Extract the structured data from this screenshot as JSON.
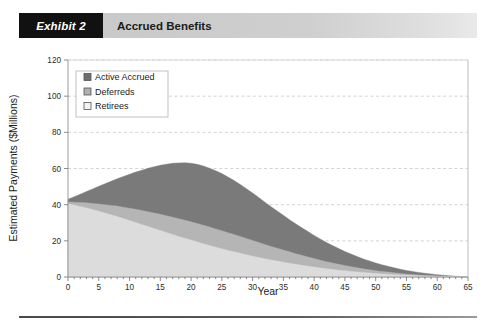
{
  "header": {
    "exhibit_tag": "Exhibit 2",
    "title": "Accrued Benefits"
  },
  "chart_data": {
    "type": "area",
    "stacked": true,
    "title": "Accrued Benefits",
    "xlabel": "Year",
    "ylabel": "Estimated Payments ($Millions)",
    "xlim": [
      0,
      65
    ],
    "ylim": [
      0,
      120
    ],
    "xticks": [
      0,
      5,
      10,
      15,
      20,
      25,
      30,
      35,
      40,
      45,
      50,
      55,
      60,
      65
    ],
    "yticks": [
      0,
      20,
      40,
      60,
      80,
      100,
      120
    ],
    "xtick_labels": [
      "0",
      "5",
      "10",
      "15",
      "20",
      "25",
      "30",
      "35",
      "40",
      "45",
      "50",
      "55",
      "60",
      "65"
    ],
    "ytick_labels": [
      "0",
      "20",
      "40",
      "60",
      "80",
      "100",
      "120"
    ],
    "grid": "horizontal-dashed",
    "legend_position": "upper-left-inside",
    "x": [
      0,
      1,
      2,
      3,
      4,
      5,
      6,
      7,
      8,
      9,
      10,
      11,
      12,
      13,
      14,
      15,
      16,
      17,
      18,
      19,
      20,
      21,
      22,
      23,
      24,
      25,
      26,
      27,
      28,
      29,
      30,
      31,
      32,
      33,
      34,
      35,
      36,
      37,
      38,
      39,
      40,
      41,
      42,
      43,
      44,
      45,
      46,
      47,
      48,
      49,
      50,
      51,
      52,
      53,
      54,
      55,
      56,
      57,
      58,
      59,
      60,
      61,
      62,
      63,
      64,
      65
    ],
    "series": [
      {
        "name": "Retirees",
        "color": "#dcdcdc",
        "stack_order": 1,
        "values": [
          40.5,
          39.8,
          39.0,
          38.2,
          37.3,
          36.4,
          35.4,
          34.4,
          33.4,
          32.3,
          31.2,
          30.1,
          29.0,
          27.9,
          26.8,
          25.7,
          24.6,
          23.5,
          22.4,
          21.4,
          20.4,
          19.4,
          18.4,
          17.4,
          16.5,
          15.6,
          14.7,
          13.9,
          13.1,
          12.3,
          11.5,
          10.8,
          10.1,
          9.4,
          8.8,
          8.2,
          7.6,
          7.0,
          6.5,
          6.0,
          5.5,
          5.0,
          4.6,
          4.2,
          3.8,
          3.4,
          3.1,
          2.8,
          2.5,
          2.2,
          1.9,
          1.7,
          1.5,
          1.3,
          1.1,
          0.9,
          0.8,
          0.65,
          0.55,
          0.45,
          0.35,
          0.28,
          0.2,
          0.14,
          0.08,
          0.0
        ]
      },
      {
        "name": "Deferreds",
        "color": "#b5b5b5",
        "stack_order": 2,
        "values": [
          1.0,
          1.6,
          2.2,
          2.8,
          3.4,
          4.0,
          4.6,
          5.2,
          5.8,
          6.3,
          6.8,
          7.3,
          7.8,
          8.2,
          8.6,
          9.0,
          9.3,
          9.6,
          9.8,
          10.0,
          10.1,
          10.2,
          10.2,
          10.2,
          10.1,
          10.0,
          9.8,
          9.6,
          9.3,
          9.0,
          8.7,
          8.3,
          7.9,
          7.5,
          7.1,
          6.7,
          6.3,
          5.9,
          5.5,
          5.1,
          4.7,
          4.3,
          3.9,
          3.6,
          3.2,
          2.9,
          2.6,
          2.3,
          2.0,
          1.8,
          1.6,
          1.4,
          1.2,
          1.0,
          0.85,
          0.7,
          0.6,
          0.5,
          0.4,
          0.32,
          0.25,
          0.2,
          0.15,
          0.1,
          0.05,
          0.0
        ]
      },
      {
        "name": "Active Accrued",
        "color": "#7a7a7a",
        "stack_order": 3,
        "values": [
          1.5,
          3.0,
          4.6,
          6.3,
          8.0,
          9.8,
          11.6,
          13.4,
          15.2,
          17.0,
          18.8,
          20.6,
          22.3,
          24.0,
          25.6,
          27.1,
          28.5,
          29.8,
          30.9,
          31.8,
          32.4,
          32.7,
          32.8,
          32.6,
          32.2,
          31.6,
          30.8,
          29.8,
          28.7,
          27.5,
          26.2,
          24.8,
          23.4,
          22.0,
          20.6,
          19.2,
          17.8,
          16.5,
          15.2,
          14.0,
          12.8,
          11.7,
          10.6,
          9.6,
          8.7,
          7.8,
          7.0,
          6.2,
          5.5,
          4.9,
          4.3,
          3.7,
          3.2,
          2.8,
          2.4,
          2.0,
          1.7,
          1.4,
          1.1,
          0.9,
          0.7,
          0.5,
          0.35,
          0.22,
          0.1,
          0.0
        ]
      }
    ],
    "totals": [
      43.0,
      44.4,
      45.8,
      47.3,
      48.7,
      50.2,
      51.6,
      53.0,
      54.4,
      55.6,
      56.8,
      58.0,
      59.1,
      60.1,
      61.0,
      61.8,
      62.4,
      62.9,
      63.1,
      63.2,
      62.9,
      62.3,
      61.4,
      60.2,
      58.8,
      57.2,
      55.3,
      53.3,
      51.1,
      48.8,
      46.4,
      43.9,
      41.4,
      38.9,
      36.5,
      34.1,
      31.7,
      29.4,
      27.2,
      25.1,
      23.0,
      21.0,
      19.1,
      17.4,
      15.7,
      14.1,
      12.7,
      11.3,
      10.0,
      8.9,
      7.8,
      6.8,
      5.9,
      5.1,
      4.35,
      3.6,
      3.1,
      2.55,
      2.05,
      1.67,
      1.3,
      0.98,
      0.7,
      0.46,
      0.23,
      0.0
    ]
  },
  "legend": {
    "items": [
      {
        "label": "Active Accrued",
        "swatch": "#6f6f6f"
      },
      {
        "label": "Deferreds",
        "swatch": "#b0b0b0"
      },
      {
        "label": "Retirees",
        "swatch": "#f2f2f2"
      }
    ]
  }
}
